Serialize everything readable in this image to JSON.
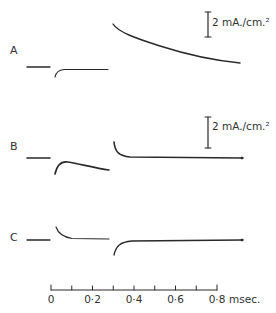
{
  "figure": {
    "panels": [
      {
        "label": "A",
        "scale_bar": "2 mA./cm.²"
      },
      {
        "label": "B",
        "scale_bar": "2 mA./cm.²"
      },
      {
        "label": "C"
      }
    ],
    "time_axis": {
      "tick_labels": [
        "0",
        "0·2",
        "0·4",
        "0·6",
        "0·8"
      ],
      "unit": "msec.",
      "range_ms": [
        0,
        0.8
      ],
      "minor_tick_step_ms": 0.1
    },
    "colors": {
      "trace": "#2a2a2a",
      "background": "#ffffff"
    }
  }
}
